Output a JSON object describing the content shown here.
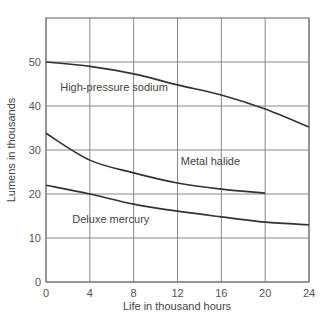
{
  "chart_data": {
    "type": "line",
    "title": "",
    "xlabel": "Life in thousand hours",
    "ylabel": "Lumens in thousands",
    "xlim": [
      0,
      24
    ],
    "ylim": [
      0,
      60
    ],
    "x_ticks": [
      0,
      4,
      8,
      12,
      16,
      20,
      24
    ],
    "y_ticks": [
      0,
      10,
      20,
      30,
      40,
      50
    ],
    "grid": true,
    "legend": "inline labels",
    "series": [
      {
        "name": "High-pressure sodium",
        "x": [
          0,
          4,
          8,
          12,
          16,
          20,
          24
        ],
        "values": [
          50,
          49,
          47.3,
          44.8,
          42.5,
          39.3,
          35.2
        ],
        "label_pos": [
          1.3,
          43.5
        ]
      },
      {
        "name": "Metal halide",
        "x": [
          0,
          4,
          8,
          12,
          16,
          20
        ],
        "values": [
          33.8,
          27.7,
          24.8,
          22.5,
          21.1,
          20.2
        ],
        "label_pos": [
          12.3,
          26.5
        ]
      },
      {
        "name": "Deluxe mercury",
        "x": [
          0,
          4,
          8,
          12,
          16,
          20,
          24
        ],
        "values": [
          22,
          20,
          17.7,
          16.1,
          14.8,
          13.6,
          13
        ],
        "label_pos": [
          2.4,
          13.5
        ]
      }
    ]
  },
  "layout": {
    "plot_left": 46,
    "plot_right": 309,
    "plot_top": 18,
    "plot_bottom": 282
  }
}
